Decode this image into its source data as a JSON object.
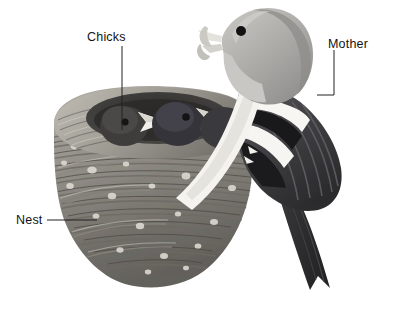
{
  "figure": {
    "kind": "labelled-illustration",
    "background_color": "#ffffff",
    "label_color": "#141414",
    "leader_line_color": "#222222",
    "palette": {
      "nest_light": "#b9b5ad",
      "nest_mid": "#8d8a83",
      "nest_dark": "#5d5b56",
      "nest_shadow": "#3e3d3a",
      "nest_speck": "#d8d5cd",
      "chick_body": "#3c3b3a",
      "chick_body_light": "#58575a",
      "beak_light": "#efeee9",
      "bird_head": "#a9a7a4",
      "bird_head_light": "#c3c1bd",
      "bird_breast": "#d9d7d2",
      "bird_wing_dark": "#3a3a3c",
      "bird_wing_mid": "#6b6b6e",
      "bird_white": "#f7f6f3",
      "bird_tail": "#2f2f31",
      "eye": "#111111"
    }
  },
  "labels": [
    {
      "id": "chicks",
      "text": "Chicks",
      "leader": "vertical line from label down into the nest cup",
      "x": 87,
      "y": 31
    },
    {
      "id": "mother",
      "text": "Mother",
      "leader": "vertical line down then horizontal elbow to the bird's back",
      "x": 328,
      "y": 38
    },
    {
      "id": "nest",
      "text": "Nest",
      "leader": "horizontal line to the woven nest wall",
      "x": 16,
      "y": 214
    }
  ]
}
